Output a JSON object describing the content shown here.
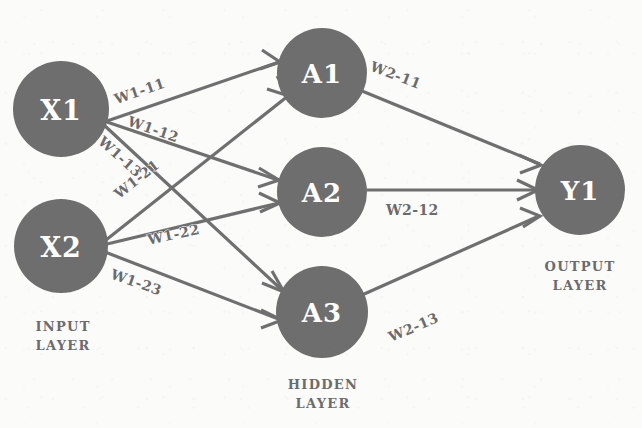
{
  "diagram": {
    "type": "neural-network",
    "colors": {
      "node_fill": "#6e6e6e",
      "node_text": "#ffffff",
      "edge": "#6f6f6f",
      "label_text": "#6b6b6b",
      "background": "#fbfbfa"
    }
  },
  "nodes": {
    "input": [
      {
        "id": "X1",
        "label": "X1",
        "cx": 61,
        "cy": 109,
        "r": 48
      },
      {
        "id": "X2",
        "label": "X2",
        "cx": 61,
        "cy": 246,
        "r": 47
      }
    ],
    "hidden": [
      {
        "id": "A1",
        "label": "A1",
        "cx": 322,
        "cy": 73,
        "r": 45
      },
      {
        "id": "A2",
        "label": "A2",
        "cx": 322,
        "cy": 192,
        "r": 45
      },
      {
        "id": "A3",
        "label": "A3",
        "cx": 322,
        "cy": 312,
        "r": 46
      }
    ],
    "output": [
      {
        "id": "Y1",
        "label": "Y1",
        "cx": 580,
        "cy": 190,
        "r": 45
      }
    ]
  },
  "edges": [
    {
      "id": "w1-11",
      "from": "X1",
      "to": "A1",
      "label": "W1-11"
    },
    {
      "id": "w1-12",
      "from": "X1",
      "to": "A2",
      "label": "W1-12"
    },
    {
      "id": "w1-13",
      "from": "X1",
      "to": "A3",
      "label": "W1-13"
    },
    {
      "id": "w1-21",
      "from": "X2",
      "to": "A1",
      "label": "W1-21"
    },
    {
      "id": "w1-22",
      "from": "X2",
      "to": "A2",
      "label": "W1-22"
    },
    {
      "id": "w1-23",
      "from": "X2",
      "to": "A3",
      "label": "W1-23"
    },
    {
      "id": "w2-11",
      "from": "A1",
      "to": "Y1",
      "label": "W2-11"
    },
    {
      "id": "w2-12",
      "from": "A2",
      "to": "Y1",
      "label": "W2-12"
    },
    {
      "id": "w2-13",
      "from": "A3",
      "to": "Y1",
      "label": "W2-13"
    }
  ],
  "weight_labels": {
    "w1_11": "W1-11",
    "w1_12": "W1-12",
    "w1_13": "W1-13",
    "w1_21": "W1-21",
    "w1_22": "W1-22",
    "w1_23": "W1-23",
    "w2_11": "W2-11",
    "w2_12": "W2-12",
    "w2_13": "W2-13"
  },
  "node_labels": {
    "x1": "X1",
    "x2": "X2",
    "a1": "A1",
    "a2": "A2",
    "a3": "A3",
    "y1": "Y1"
  },
  "captions": {
    "input_layer": "INPUT\nLAYER",
    "hidden_layer": "HIDDEN\nLAYER",
    "output_layer": "OUTPUT\nLAYER"
  }
}
